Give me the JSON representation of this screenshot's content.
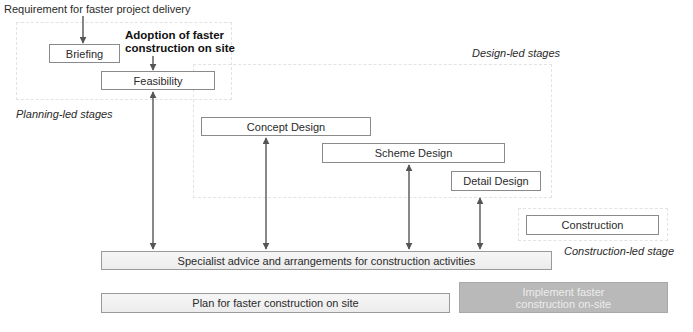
{
  "diagram": {
    "top_label": "Requirement for faster project delivery",
    "adoption_label_line1": "Adoption of faster",
    "adoption_label_line2": "construction on site",
    "zones": {
      "planning": "Planning-led stages",
      "design": "Design-led stages",
      "construction": "Construction-led stage"
    },
    "stages": {
      "briefing": "Briefing",
      "feasibility": "Feasibility",
      "concept_design": "Concept Design",
      "scheme_design": "Scheme Design",
      "detail_design": "Detail Design",
      "construction": "Construction"
    },
    "bars": {
      "specialist": "Specialist advice and arrangements for construction activities",
      "plan": "Plan for faster construction on site",
      "implement_line1": "Implement faster",
      "implement_line2": "construction on-site"
    },
    "colors": {
      "arrow": "#555555",
      "box_border": "#8a8a8a",
      "implement_fill": "#b9b9b9",
      "shaded_fill": "#efefef"
    }
  }
}
